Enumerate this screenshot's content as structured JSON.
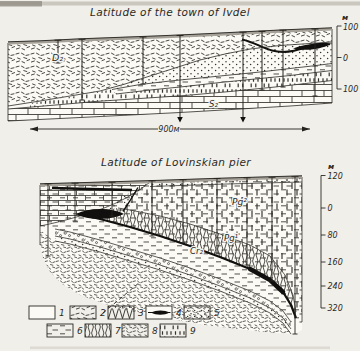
{
  "figure": {
    "top_section": {
      "title": "Latitude of the town of Ivdel",
      "axis_unit": "м",
      "axis_ticks": [
        "100",
        "0",
        "100"
      ],
      "scale_label": "900м",
      "labels": {
        "d2": "D₂",
        "s2": "S₂"
      }
    },
    "bottom_section": {
      "title": "Latitude of Lovinskian pier",
      "axis_unit": "м",
      "axis_ticks": [
        "120",
        "0",
        "80",
        "160",
        "240",
        "320"
      ],
      "labels": {
        "pg2": "Pg²",
        "pg1": "Pg¹",
        "cr2": "Cr₂"
      }
    },
    "legend": {
      "items": [
        {
          "num": "1",
          "pattern": "blank"
        },
        {
          "num": "2",
          "pattern": "speckle-coarse"
        },
        {
          "num": "3",
          "pattern": "zigzag-vertical"
        },
        {
          "num": "4",
          "pattern": "ore-lens"
        },
        {
          "num": "5",
          "pattern": "dots"
        },
        {
          "num": "6",
          "pattern": "dash-horizontal"
        },
        {
          "num": "7",
          "pattern": "wave-vertical"
        },
        {
          "num": "8",
          "pattern": "speckle-fine"
        },
        {
          "num": "9",
          "pattern": "dash-brick"
        }
      ]
    },
    "colors": {
      "paper": "#f0efe9",
      "ink": "#2b2925",
      "pattern_ink": "#34312b",
      "surface_gray": "#a5a198"
    }
  }
}
